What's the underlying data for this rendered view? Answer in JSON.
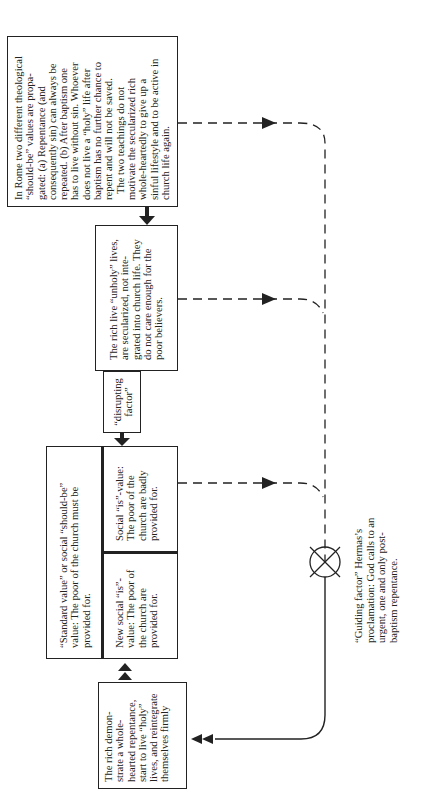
{
  "diagram": {
    "orientation": "rotated-90-ccw",
    "boxes": {
      "theological_values": {
        "lines": [
          "In Rome two different theological",
          "“should-be” values are propa-",
          "gated: (a) Repentance (and",
          "consequently sin) can always be",
          "repeated. (b) After baptism one",
          "has to live without sin. Whoever",
          "does not live a “holy” life after",
          "baptism has no further chance to",
          "repent and will not be saved."
        ],
        "lines2": [
          "The two teachings do not",
          "motivate the secularized rich",
          "whole-heartedly to give up a",
          "sinful lifestyle and to be active in",
          "church life again."
        ]
      },
      "rich_unholy": {
        "lines": [
          "The rich live “unholy” lives,",
          "are secularized, not inte-",
          "grated into church life. They",
          "do not care enough for the",
          "poor believers."
        ]
      },
      "disrupting_factor": {
        "lines": [
          "“disrupting",
          "factor”"
        ]
      },
      "standard_value": {
        "lines": [
          "“Standard value” or social “should-be”",
          "value: The poor of the church must be",
          "provided for."
        ]
      },
      "social_is_value": {
        "lines": [
          "Social “is”-value:",
          "The poor of the",
          "church are badly",
          "provided for."
        ]
      },
      "new_social_is_value": {
        "lines": [
          "New social “is”-",
          "value: The poor of",
          "the church are",
          "provided for."
        ]
      },
      "rich_repentance": {
        "lines": [
          "The rich demon-",
          "strate a whole-",
          "hearted repentance,",
          "start to live “holy”",
          "lives, and reintegrate",
          "themselves firmly"
        ]
      }
    },
    "guiding_factor": {
      "lines": [
        "“Guiding factor” Hermas’s",
        "proclamation: God calls to an",
        "urgent, one and only post-",
        "baptism repentance."
      ]
    },
    "colors": {
      "line": "#222222",
      "background": "#ffffff"
    },
    "icons": {
      "comparator": "circle-with-x",
      "arrow_right": "filled-triangle-arrowhead",
      "arrow_down": "filled-down-arrow",
      "double_arrow": "double-triangle-arrowhead"
    }
  }
}
